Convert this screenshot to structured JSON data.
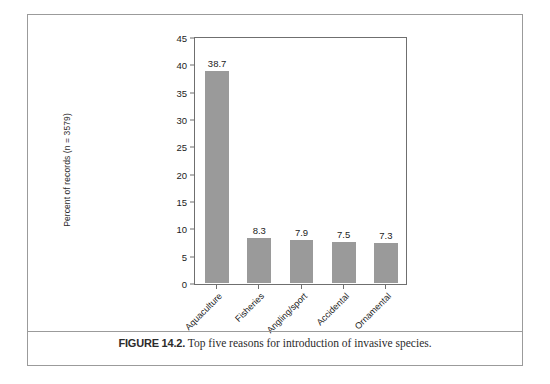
{
  "figure": {
    "caption_number": "FIGURE 14.2.",
    "caption_text": "Top five reasons for introduction of invasive species."
  },
  "chart_data": {
    "type": "bar",
    "title": "",
    "categories": [
      "Aquaculture",
      "Fisheries",
      "Angling/sport",
      "Accidental",
      "Ornamental"
    ],
    "values": [
      38.7,
      8.3,
      7.9,
      7.5,
      7.3
    ],
    "data_labels": [
      "38.7",
      "8.3",
      "7.9",
      "7.5",
      "7.3"
    ],
    "xlabel": "",
    "ylabel": "Percent of records (n = 3579)",
    "ylim": [
      0,
      45
    ],
    "ytick_values": [
      0,
      5,
      10,
      15,
      20,
      25,
      30,
      35,
      40,
      45
    ],
    "ytick_labels": [
      "0",
      "5",
      "10",
      "15",
      "20",
      "25",
      "30",
      "35",
      "40",
      "45"
    ],
    "grid": false,
    "legend": false,
    "bar_color": "#9a9a9a",
    "axis_color": "#6f6f6f",
    "xlabel_rotation": -45
  }
}
